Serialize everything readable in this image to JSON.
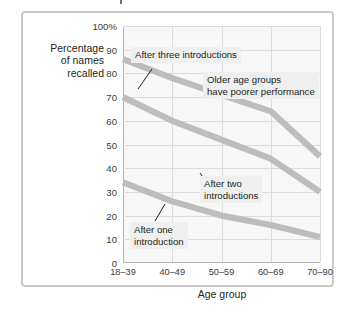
{
  "figure": {
    "background_color": "#ffffff",
    "frame_color": "#c9c9c9",
    "plot_background_color": "#f7f7f7",
    "gridline_color": "#dcdcdc",
    "line_color": "#bdbdbd",
    "annotation_background_color": "#efefef",
    "text_color": "#231f20"
  },
  "chart_data": {
    "type": "line",
    "title": "",
    "subtitle": "",
    "xlabel": "Age group",
    "ylabel": "Percentage\nof names\nrecalled",
    "categories": [
      "18–39",
      "40–49",
      "50–59",
      "60–69",
      "70–90"
    ],
    "ylim": [
      0,
      100
    ],
    "yticks": [
      0,
      10,
      20,
      30,
      40,
      50,
      60,
      70,
      80,
      90,
      100
    ],
    "ytick_labels": [
      "0",
      "10",
      "20",
      "30",
      "40",
      "50",
      "60",
      "70",
      "80",
      "90",
      "100%"
    ],
    "grid": true,
    "legend": "none",
    "series": [
      {
        "name": "After three introductions",
        "values": [
          86,
          78,
          71,
          64,
          45
        ]
      },
      {
        "name": "After two introductions",
        "values": [
          70,
          60,
          52,
          44,
          30
        ]
      },
      {
        "name": "After one introduction",
        "values": [
          34,
          26,
          20,
          16,
          11
        ]
      }
    ],
    "annotations": [
      {
        "id": "after-three-introductions",
        "text": "After three introductions",
        "has_leader_line": true
      },
      {
        "id": "older-age-groups",
        "text": "Older age groups\nhave poorer performance",
        "has_leader_line": false
      },
      {
        "id": "after-two-introductions",
        "text": "After two\nintroductions",
        "has_leader_line": true
      },
      {
        "id": "after-one-introduction",
        "text": "After one\nintroduction",
        "has_leader_line": true
      }
    ]
  }
}
